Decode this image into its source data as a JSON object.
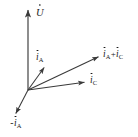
{
  "figure": {
    "type": "phasor-diagram",
    "title": "",
    "background_color": "#ffffff",
    "stroke_color": "#3a3a3a",
    "text_color": "#1a1a1a",
    "width": 138,
    "height": 137
  },
  "origin": {
    "x": 28,
    "y": 90
  },
  "vectors": [
    {
      "id": "u",
      "symbol": "U",
      "subscript": "",
      "overdot": true,
      "label_text": "U",
      "tip": {
        "x": 28,
        "y": 6
      },
      "direction_deg": 90,
      "length_px": 84
    },
    {
      "id": "ia",
      "symbol": "i",
      "subscript": "A",
      "overdot": true,
      "label_text": "iA",
      "tip": {
        "x": 45,
        "y": 65
      },
      "direction_deg": 56,
      "length_px": 30
    },
    {
      "id": "ia-plus-ic",
      "symbol": "i",
      "subscript": "A",
      "symbol2": "i",
      "subscript2": "C",
      "operator": "+",
      "overdot": true,
      "label_text": "iA + iC",
      "tip": {
        "x": 101,
        "y": 55
      },
      "direction_deg": 25,
      "length_px": 80
    },
    {
      "id": "ic",
      "symbol": "i",
      "subscript": "C",
      "overdot": true,
      "label_text": "iC",
      "tip": {
        "x": 87,
        "y": 81
      },
      "direction_deg": 9,
      "length_px": 60
    },
    {
      "id": "minus-ia",
      "symbol": "i",
      "subscript": "A",
      "operator": "−",
      "overdot": true,
      "label_text": "- iA",
      "tip": {
        "x": 14,
        "y": 116
      },
      "direction_deg": 236,
      "length_px": 30
    }
  ],
  "labels": {
    "u": {
      "operator": "",
      "symbol": "U",
      "subscript": ""
    },
    "ia": {
      "operator": "",
      "symbol": "i",
      "subscript": "A"
    },
    "ia_plus_ic": {
      "symbol_a": "i",
      "subscript_a": "A",
      "operator": "+",
      "symbol_b": "i",
      "subscript_b": "C"
    },
    "ic": {
      "operator": "",
      "symbol": "i",
      "subscript": "C"
    },
    "minus_ia": {
      "operator": "-",
      "symbol": "i",
      "subscript": "A"
    }
  }
}
